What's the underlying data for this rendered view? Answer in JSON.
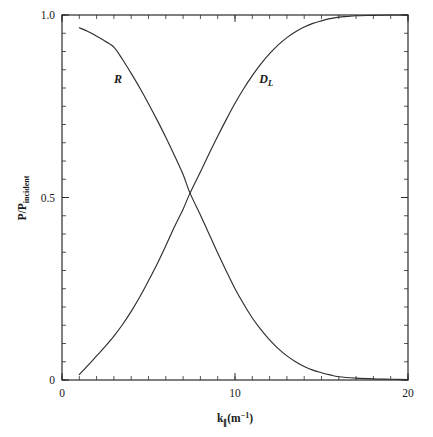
{
  "chart_data": {
    "type": "line",
    "title": "",
    "xlabel": "k∥(m⁻¹)",
    "xlabel_base": "k",
    "xlabel_parallel": "∥",
    "xlabel_unit_open": "(m",
    "xlabel_unit_exp": "−1",
    "xlabel_unit_close": ")",
    "ylabel": "P/P_incident",
    "ylabel_base": "P/P",
    "ylabel_sub": "incident",
    "xlim": [
      0,
      20
    ],
    "ylim": [
      0,
      1.0
    ],
    "xticks": [
      0,
      10,
      20
    ],
    "xtick_labels": [
      "0",
      "10",
      "20"
    ],
    "x_minor_step": 1,
    "yticks": [
      0,
      0.5,
      1.0
    ],
    "ytick_labels": [
      "0",
      "0.5",
      "1.0"
    ],
    "y_minor_step": 0.05,
    "grid": false,
    "legend_position": "inline-annotations",
    "annotations": [
      {
        "text": "R",
        "x": 3.0,
        "y": 0.815,
        "name": "curve-label-R"
      },
      {
        "text": "D",
        "sub": "L",
        "x": 11.4,
        "y": 0.815,
        "name": "curve-label-DL"
      }
    ],
    "series": [
      {
        "name": "R",
        "label": "R",
        "color": "#2f2f2f",
        "x": [
          1.0,
          1.5,
          2.0,
          2.5,
          3.0,
          3.5,
          4.0,
          4.5,
          5.0,
          5.5,
          6.0,
          6.5,
          7.0,
          7.4,
          8.0,
          8.5,
          9.0,
          9.5,
          10.0,
          10.5,
          11.0,
          11.5,
          12.0,
          12.5,
          13.0,
          13.5,
          14.0,
          14.5,
          15.0,
          15.5,
          16.0,
          17.0,
          18.0,
          19.0,
          20.0
        ],
        "y": [
          0.965,
          0.955,
          0.942,
          0.928,
          0.912,
          0.878,
          0.84,
          0.8,
          0.757,
          0.712,
          0.665,
          0.615,
          0.563,
          0.512,
          0.452,
          0.4,
          0.348,
          0.298,
          0.25,
          0.208,
          0.17,
          0.138,
          0.11,
          0.086,
          0.066,
          0.05,
          0.037,
          0.027,
          0.02,
          0.014,
          0.009,
          0.005,
          0.003,
          0.002,
          0.001
        ]
      },
      {
        "name": "D_L",
        "label": "D_L",
        "color": "#2f2f2f",
        "x": [
          1.0,
          1.5,
          2.0,
          2.5,
          3.0,
          3.5,
          4.0,
          4.5,
          5.0,
          5.5,
          6.0,
          6.5,
          7.0,
          7.4,
          8.0,
          8.5,
          9.0,
          9.5,
          10.0,
          10.5,
          11.0,
          11.5,
          12.0,
          12.5,
          13.0,
          13.5,
          14.0,
          14.5,
          15.0,
          15.5,
          16.0,
          16.5,
          17.0,
          18.0,
          19.0,
          20.0
        ],
        "y": [
          0.015,
          0.04,
          0.066,
          0.092,
          0.12,
          0.152,
          0.188,
          0.228,
          0.272,
          0.318,
          0.368,
          0.42,
          0.468,
          0.512,
          0.57,
          0.62,
          0.668,
          0.714,
          0.758,
          0.798,
          0.834,
          0.866,
          0.894,
          0.918,
          0.938,
          0.954,
          0.967,
          0.977,
          0.984,
          0.99,
          0.994,
          0.996,
          0.998,
          0.999,
          1.0,
          1.0
        ]
      }
    ]
  }
}
